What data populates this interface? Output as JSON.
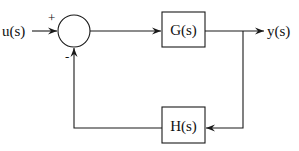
{
  "diagram": {
    "type": "feedback-control-block-diagram",
    "input": {
      "label": "u(s)"
    },
    "output": {
      "label": "y(s)"
    },
    "summing_junction": {
      "plus_sign": "+",
      "minus_sign": "-"
    },
    "blocks": [
      {
        "id": "forward",
        "label": "G(s)"
      },
      {
        "id": "feedback",
        "label": "H(s)"
      }
    ],
    "edges": [
      {
        "from": "u(s)",
        "to": "summing_junction",
        "sign": "+"
      },
      {
        "from": "summing_junction",
        "to": "G(s)"
      },
      {
        "from": "G(s)",
        "to": "y(s)"
      },
      {
        "from": "y(s)",
        "to": "H(s)"
      },
      {
        "from": "H(s)",
        "to": "summing_junction",
        "sign": "-"
      }
    ]
  }
}
